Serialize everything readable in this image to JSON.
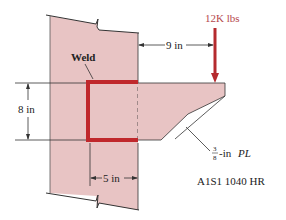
{
  "figure": {
    "type": "engineering-diagram",
    "labels": {
      "weld": "Weld",
      "load": "12K lbs",
      "horizontal_distance": "9 in",
      "height": "8 in",
      "width": "5 in",
      "plate_thickness_fraction_num": "3",
      "plate_thickness_fraction_den": "8",
      "plate_thickness_suffix": "-in ",
      "plate_designation": "PL",
      "material": "A1S1 1040 HR"
    },
    "colors": {
      "steel_fill": "#e8c4c4",
      "weld": "#c0282c",
      "load_arrow": "#b52a2e",
      "load_text": "#b5484c",
      "line": "#333333"
    }
  }
}
